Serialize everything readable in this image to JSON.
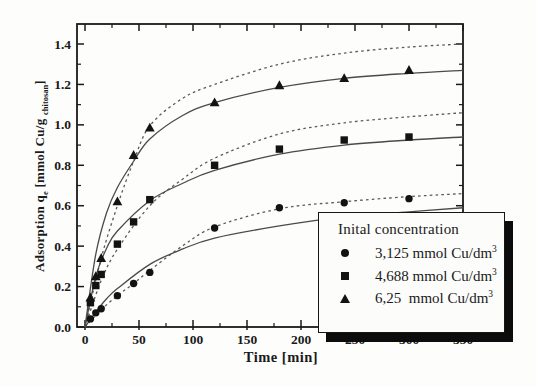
{
  "figure": {
    "xlabel": "Time [min]",
    "ylabel": {
      "pre": "Adsorption q",
      "sub1": "e",
      "mid": " [mmol Cu/g ",
      "sub2": "chitosan",
      "post": "]"
    }
  },
  "legend": {
    "title": "Inital concentration",
    "items": [
      {
        "marker": "circle",
        "label": "3,125 mmol Cu/dm",
        "sup": "3"
      },
      {
        "marker": "square",
        "label": "4,688 mmol Cu/dm",
        "sup": "3"
      },
      {
        "marker": "triangle",
        "label": "6,25  mmol Cu/dm",
        "sup": "3"
      }
    ]
  },
  "chart_data": {
    "type": "scatter",
    "title": "",
    "xlabel": "Time [min]",
    "ylabel": "Adsorption q_e [mmol Cu/g chitosan]",
    "xlim": [
      0,
      350
    ],
    "ylim": [
      0,
      1.5
    ],
    "grid": false,
    "legend_position": "lower right",
    "x_major_ticks": [
      0,
      50,
      100,
      150,
      200,
      250,
      300,
      350
    ],
    "x_minor_ticks": [
      25,
      75,
      125,
      175,
      225,
      275,
      325
    ],
    "y_major_tick_labels": [
      "0.0",
      "0.2",
      "0.4",
      "0.6",
      "0.8",
      "1.0",
      "1.2",
      "1.4"
    ],
    "y_minor_ticks": [
      0.1,
      0.3,
      0.5,
      0.7,
      0.9,
      1.1,
      1.3
    ],
    "colors": {
      "ink": "#1a1a1a",
      "curve_solid": "#4a4a4a",
      "curve_dashed": "#5a5a5a"
    },
    "series": [
      {
        "name": "3,125 mmol Cu/dm3",
        "marker": "circle",
        "points": [
          [
            5,
            0.04
          ],
          [
            10,
            0.07
          ],
          [
            15,
            0.09
          ],
          [
            30,
            0.155
          ],
          [
            45,
            0.215
          ],
          [
            60,
            0.27
          ],
          [
            120,
            0.49
          ],
          [
            180,
            0.59
          ],
          [
            240,
            0.615
          ],
          [
            300,
            0.635
          ]
        ]
      },
      {
        "name": "4,688 mmol Cu/dm3",
        "marker": "square",
        "points": [
          [
            5,
            0.12
          ],
          [
            10,
            0.205
          ],
          [
            15,
            0.26
          ],
          [
            30,
            0.41
          ],
          [
            45,
            0.52
          ],
          [
            60,
            0.63
          ],
          [
            120,
            0.8
          ],
          [
            180,
            0.88
          ],
          [
            240,
            0.925
          ],
          [
            300,
            0.94
          ]
        ]
      },
      {
        "name": "6,25 mmol Cu/dm3",
        "marker": "triangle",
        "points": [
          [
            5,
            0.145
          ],
          [
            10,
            0.25
          ],
          [
            15,
            0.34
          ],
          [
            30,
            0.62
          ],
          [
            45,
            0.85
          ],
          [
            60,
            0.985
          ],
          [
            120,
            1.11
          ],
          [
            180,
            1.195
          ],
          [
            240,
            1.23
          ],
          [
            300,
            1.27
          ]
        ]
      }
    ],
    "fit_curves": {
      "solid": [
        {
          "series": "3,125 mmol Cu/dm3",
          "points": [
            [
              0,
              0
            ],
            [
              10,
              0.075
            ],
            [
              20,
              0.14
            ],
            [
              30,
              0.19
            ],
            [
              60,
              0.31
            ],
            [
              90,
              0.385
            ],
            [
              120,
              0.44
            ],
            [
              180,
              0.5
            ],
            [
              240,
              0.545
            ],
            [
              300,
              0.57
            ],
            [
              350,
              0.59
            ]
          ]
        },
        {
          "series": "4,688 mmol Cu/dm3",
          "points": [
            [
              0,
              0
            ],
            [
              10,
              0.25
            ],
            [
              20,
              0.39
            ],
            [
              30,
              0.475
            ],
            [
              60,
              0.625
            ],
            [
              90,
              0.71
            ],
            [
              120,
              0.775
            ],
            [
              180,
              0.855
            ],
            [
              240,
              0.9
            ],
            [
              300,
              0.925
            ],
            [
              350,
              0.94
            ]
          ]
        },
        {
          "series": "6,25 mmol Cu/dm3",
          "points": [
            [
              0,
              0
            ],
            [
              10,
              0.36
            ],
            [
              20,
              0.565
            ],
            [
              30,
              0.69
            ],
            [
              45,
              0.82
            ],
            [
              60,
              0.93
            ],
            [
              90,
              1.045
            ],
            [
              120,
              1.11
            ],
            [
              180,
              1.185
            ],
            [
              240,
              1.23
            ],
            [
              300,
              1.255
            ],
            [
              350,
              1.27
            ]
          ]
        }
      ],
      "dashed": [
        {
          "series": "3,125 mmol Cu/dm3",
          "points": [
            [
              0,
              0
            ],
            [
              15,
              0.085
            ],
            [
              30,
              0.155
            ],
            [
              45,
              0.215
            ],
            [
              60,
              0.28
            ],
            [
              90,
              0.4
            ],
            [
              120,
              0.495
            ],
            [
              180,
              0.585
            ],
            [
              240,
              0.62
            ],
            [
              300,
              0.645
            ],
            [
              350,
              0.66
            ]
          ]
        },
        {
          "series": "4,688 mmol Cu/dm3",
          "points": [
            [
              0,
              0
            ],
            [
              15,
              0.23
            ],
            [
              30,
              0.385
            ],
            [
              60,
              0.6
            ],
            [
              90,
              0.73
            ],
            [
              120,
              0.835
            ],
            [
              180,
              0.955
            ],
            [
              240,
              1.01
            ],
            [
              300,
              1.04
            ],
            [
              350,
              1.06
            ]
          ]
        },
        {
          "series": "6,25 mmol Cu/dm3",
          "points": [
            [
              0,
              0
            ],
            [
              15,
              0.34
            ],
            [
              30,
              0.6
            ],
            [
              45,
              0.82
            ],
            [
              60,
              0.995
            ],
            [
              90,
              1.13
            ],
            [
              120,
              1.2
            ],
            [
              180,
              1.3
            ],
            [
              240,
              1.355
            ],
            [
              300,
              1.385
            ],
            [
              350,
              1.4
            ]
          ]
        }
      ]
    }
  }
}
